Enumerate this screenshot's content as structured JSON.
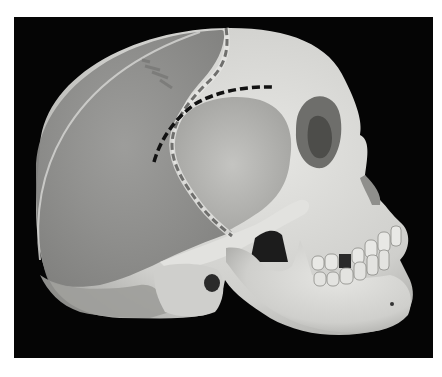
{
  "image": {
    "subject": "lateral view of human skull with shaded parietal/occipital overlay and dashed suture lines",
    "colors": {
      "page_background": "#ffffff",
      "photo_background": "#050505",
      "bone": "#d9d9d6",
      "bone_shadow": "#a8a8a4",
      "overlay_gray": "#8e8e8c",
      "overlay_rim": "#c9c9c6",
      "dash_black": "#111111",
      "dash_gray": "#6f6f6d",
      "cavity": "#1a1a1a"
    },
    "annotations": [
      {
        "name": "coronal-suture-line",
        "style": "dashed",
        "color": "gray"
      },
      {
        "name": "temporal-line",
        "style": "dashed",
        "color": "black"
      }
    ]
  }
}
